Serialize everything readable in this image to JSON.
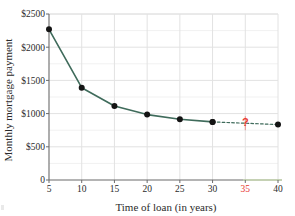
{
  "chart_data": {
    "type": "line",
    "title": "",
    "xlabel": "Time of loan (in years)",
    "ylabel": "Monthly mortgage payment",
    "xlim": [
      5,
      40
    ],
    "ylim": [
      0,
      2500
    ],
    "grid": true,
    "legend": "none",
    "x_ticks": [
      "5",
      "10",
      "15",
      "20",
      "25",
      "30",
      "35",
      "40"
    ],
    "x_tick_values": [
      5,
      10,
      15,
      20,
      25,
      30,
      35,
      40
    ],
    "highlighted_x_tick": "35",
    "y_ticks": [
      "0",
      "$500",
      "$1000",
      "$1500",
      "$2000",
      "$2500"
    ],
    "y_tick_values": [
      0,
      500,
      1000,
      1500,
      2000,
      2500
    ],
    "series": [
      {
        "name": "Monthly mortgage payment",
        "style": "solid",
        "color": "#3f6b5b",
        "marker": "filled-circle",
        "x": [
          5,
          10,
          15,
          20,
          25,
          30
        ],
        "values": [
          2270,
          1390,
          1115,
          985,
          915,
          875
        ]
      },
      {
        "name": "Extrapolated segment",
        "style": "dotted",
        "color": "#3f6b5b",
        "marker": "filled-circle",
        "x": [
          30,
          40
        ],
        "values": [
          875,
          835
        ]
      }
    ],
    "annotations": [
      {
        "label": "?",
        "x": 35,
        "y": 855,
        "color": "#e8382f",
        "description": "unknown value at 35 years"
      }
    ]
  },
  "axes": {
    "y_axis_title": "Monthly mortgage payment",
    "x_axis_title": "Time of loan (in years)"
  },
  "colors": {
    "line": "#3f6b5b",
    "marker": "#141414",
    "highlight": "#e8382f",
    "grid": "#e2e2e2",
    "axis": "#6b6b6b",
    "background": "#ffffff"
  }
}
